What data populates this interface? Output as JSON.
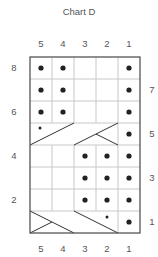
{
  "title": "Chart D",
  "columns": [
    "5",
    "4",
    "3",
    "2",
    "1"
  ],
  "left_row_labels": [
    "8",
    "6",
    "4",
    "2"
  ],
  "right_row_labels": [
    "7",
    "5",
    "3",
    "1"
  ],
  "colors": {
    "grid": "#c8c8c8",
    "border": "#555555",
    "dot": "#222222",
    "line": "#333333"
  },
  "rows": [
    {
      "row": 8,
      "cells": [
        "purl",
        "purl",
        "knit",
        "knit",
        "purl"
      ]
    },
    {
      "row": 7,
      "cells": [
        "purl",
        "purl",
        "knit",
        "knit",
        "purl"
      ]
    },
    {
      "row": 6,
      "cells": [
        "purl",
        "purl",
        "knit",
        "knit",
        "purl"
      ]
    },
    {
      "row": 5,
      "cells": [
        "cable-2-over-2-right-with-purl",
        "cable",
        "cable",
        "cable-2-over-1-left",
        "purl"
      ]
    },
    {
      "row": 4,
      "cells": [
        "knit",
        "knit",
        "purl",
        "purl",
        "purl"
      ]
    },
    {
      "row": 3,
      "cells": [
        "knit",
        "knit",
        "purl",
        "purl",
        "purl"
      ]
    },
    {
      "row": 2,
      "cells": [
        "knit",
        "knit",
        "purl",
        "purl",
        "purl"
      ]
    },
    {
      "row": 1,
      "cells": [
        "cable-2-over-1-right",
        "cable",
        "cable-2-over-2-left-with-purl",
        "cable",
        "purl"
      ]
    }
  ]
}
